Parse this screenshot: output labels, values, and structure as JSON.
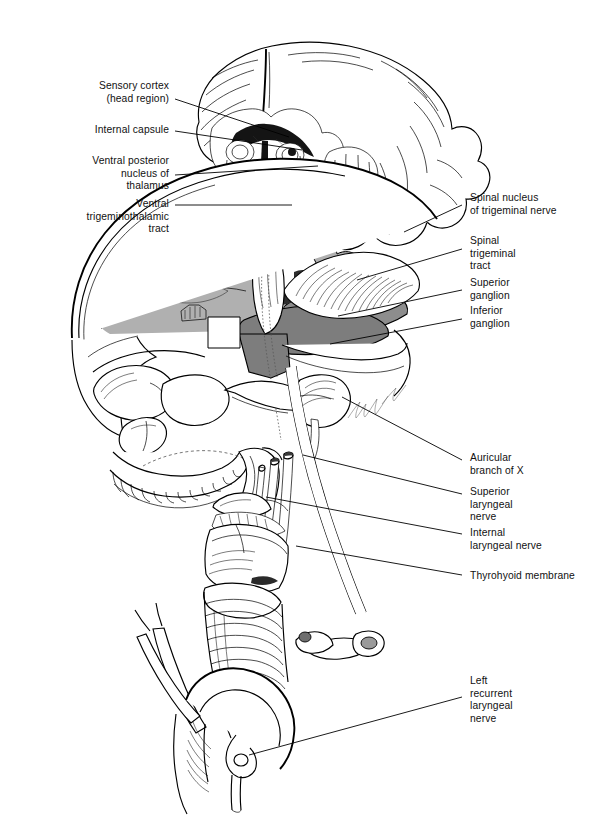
{
  "figure": {
    "kind": "anatomical-line-illustration",
    "background": "#ffffff",
    "ink_color": "#000000",
    "signature": "Donna Pinnick",
    "shading": {
      "cranial_fossa_light_gray": "#b0b0b0",
      "tentorium_mid_gray": "#9a9a9a",
      "brainstem_dark_gray": "#7d7d7d",
      "deep_shadow": "#3a3a3a",
      "paper_white": "#ffffff"
    }
  },
  "labels_left": [
    {
      "id": "sensory-cortex",
      "text": "Sensory cortex\n(head region)",
      "x": 41,
      "y": 80,
      "w": 128,
      "anchor_x": 175,
      "anchor_y": 99,
      "tip_x": 289,
      "tip_y": 137
    },
    {
      "id": "internal-capsule",
      "text": "Internal capsule",
      "x": 41,
      "y": 124,
      "w": 128,
      "anchor_x": 175,
      "anchor_y": 131,
      "tip_x": 302,
      "tip_y": 150
    },
    {
      "id": "ventral-posterior-nucleus",
      "text": "Ventral posterior\nnucleus of\nthalamus",
      "x": 41,
      "y": 155,
      "w": 128,
      "anchor_x": 175,
      "anchor_y": 175,
      "tip_x": 318,
      "tip_y": 166
    },
    {
      "id": "ventral-trigeminothalamic",
      "text": "Ventral\ntrigeminothalamic\ntract",
      "x": 21,
      "y": 198,
      "w": 148,
      "anchor_x": 175,
      "anchor_y": 205,
      "tip_x": 292,
      "tip_y": 205
    }
  ],
  "labels_right": [
    {
      "id": "spinal-nucleus-trigeminal",
      "text": "Spinal nucleus\nof trigeminal nerve",
      "x": 470,
      "y": 192,
      "w": 134,
      "anchor_x": 462,
      "anchor_y": 205,
      "tip_x": 404,
      "tip_y": 232
    },
    {
      "id": "spinal-trigeminal-tract",
      "text": "Spinal\ntrigeminal\ntract",
      "x": 470,
      "y": 235,
      "w": 134,
      "anchor_x": 462,
      "anchor_y": 249,
      "tip_x": 357,
      "tip_y": 280
    },
    {
      "id": "superior-ganglion",
      "text": "Superior\nganglion",
      "x": 470,
      "y": 277,
      "w": 134,
      "anchor_x": 462,
      "anchor_y": 290,
      "tip_x": 338,
      "tip_y": 316
    },
    {
      "id": "inferior-ganglion",
      "text": "Inferior\nganglion",
      "x": 470,
      "y": 305,
      "w": 134,
      "anchor_x": 462,
      "anchor_y": 319,
      "tip_x": 330,
      "tip_y": 344
    },
    {
      "id": "auricular-branch-of-x",
      "text": "Auricular\nbranch of X",
      "x": 470,
      "y": 452,
      "w": 134,
      "anchor_x": 462,
      "anchor_y": 460,
      "tip_x": 342,
      "tip_y": 397
    },
    {
      "id": "superior-laryngeal-nerve",
      "text": "Superior\nlaryngeal\nnerve",
      "x": 470,
      "y": 486,
      "w": 134,
      "anchor_x": 462,
      "anchor_y": 494,
      "tip_x": 303,
      "tip_y": 455
    },
    {
      "id": "internal-laryngeal-nerve",
      "text": "Internal\nlaryngeal nerve",
      "x": 470,
      "y": 527,
      "w": 134,
      "anchor_x": 462,
      "anchor_y": 534,
      "tip_x": 266,
      "tip_y": 497
    },
    {
      "id": "thyrohyoid-membrane",
      "text": "Thyrohyoid membrane",
      "x": 470,
      "y": 570,
      "w": 136,
      "anchor_x": 462,
      "anchor_y": 575,
      "tip_x": 296,
      "tip_y": 546
    },
    {
      "id": "left-recurrent-laryngeal",
      "text": "Left\nrecurrent\nlaryngeal\nnerve",
      "x": 470,
      "y": 675,
      "w": 134,
      "anchor_x": 462,
      "anchor_y": 697,
      "tip_x": 249,
      "tip_y": 755
    }
  ]
}
